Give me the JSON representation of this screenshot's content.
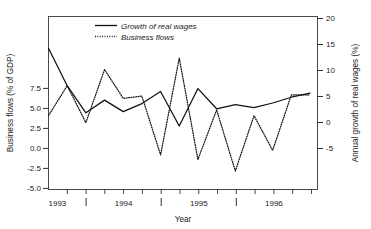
{
  "chart_data": {
    "type": "line",
    "title": "",
    "xlabel": "Year",
    "ylabel": "Business flows (% of GDP)",
    "y2label": "Annual growth of real wages (%)",
    "grid": false,
    "legend_position": "top-left-inside",
    "x": [
      "1993 Q1",
      "1993 Q2",
      "1993 Q3",
      "1993 Q4",
      "1994 Q1",
      "1994 Q2",
      "1994 Q3",
      "1994 Q4",
      "1995 Q1",
      "1995 Q2",
      "1995 Q3",
      "1995 Q4",
      "1996 Q1",
      "1996 Q2",
      "1996 Q3"
    ],
    "xtick_labels": [
      "1993",
      "1994",
      "1995",
      "1996"
    ],
    "xtick_values": [
      1993,
      1994,
      1995,
      1996
    ],
    "xlim": [
      1993.0,
      1996.6
    ],
    "ytick_labels": [
      "7.5",
      "5.0",
      "2.5",
      "0.0",
      "-2.5",
      "-5.0"
    ],
    "ytick_values": [
      7.5,
      5.0,
      2.5,
      0.0,
      -2.5,
      -5.0
    ],
    "ylim": [
      -5.0,
      10.0
    ],
    "y2tick_labels": [
      "20",
      "15",
      "10",
      "5",
      "0",
      "-5"
    ],
    "y2tick_values": [
      20,
      15,
      10,
      5,
      0,
      -5
    ],
    "y2lim": [
      -8.5,
      21.5
    ],
    "series": [
      {
        "name": "Growth of real wages",
        "axis": "right",
        "style": "solid",
        "unit": "%",
        "values": [
          16.0,
          9.5,
          4.8,
          7.0,
          5.0,
          6.4,
          8.5,
          2.5,
          9.0,
          5.5,
          6.2,
          5.7,
          6.5,
          7.5,
          8.2
        ]
      },
      {
        "name": "Business flows",
        "axis": "left",
        "style": "dotted",
        "unit": "% of GDP",
        "values": [
          1.4,
          4.0,
          0.8,
          5.4,
          2.9,
          3.1,
          -2.0,
          6.4,
          -2.4,
          1.9,
          -3.4,
          1.4,
          -1.6,
          3.2,
          3.2
        ]
      }
    ]
  },
  "legend": {
    "items": [
      {
        "label": "Growth of real wages",
        "style": "solid"
      },
      {
        "label": "Business flows",
        "style": "dotted"
      }
    ]
  },
  "axes": {
    "left_title": "Business flows (% of GDP)",
    "right_title": "Annual growth of real wages (%)",
    "bottom_title": "Year"
  }
}
